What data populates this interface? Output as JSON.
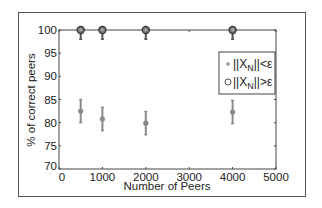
{
  "chart_data": {
    "type": "scatter",
    "title": "",
    "xlabel": "Number of Peers",
    "ylabel": "% of correct peers",
    "xlim": [
      0,
      5000
    ],
    "ylim": [
      70,
      100
    ],
    "xticks": [
      0,
      1000,
      2000,
      3000,
      4000,
      5000
    ],
    "yticks": [
      70,
      75,
      80,
      85,
      90,
      95,
      100
    ],
    "grid": false,
    "legend_position": "upper right (inside)",
    "series": [
      {
        "name": "||X_N||<ε",
        "marker": "dot",
        "color": "#8a8a8a",
        "x": [
          500,
          1000,
          2000,
          4000
        ],
        "y": [
          82.5,
          80.8,
          79.9,
          82.3
        ],
        "error": [
          2.5,
          2.5,
          2.5,
          2.5
        ]
      },
      {
        "name": "||X_N||>ε",
        "marker": "circle",
        "color": "#555555",
        "x": [
          500,
          1000,
          2000,
          4000
        ],
        "y": [
          100,
          100,
          100,
          100
        ],
        "error_lower": [
          2.0,
          2.0,
          2.0,
          2.0
        ]
      }
    ]
  },
  "axes": {
    "xlabel": "Number of Peers",
    "ylabel": "% of correct peers",
    "xtick_labels": [
      "0",
      "1000",
      "2000",
      "3000",
      "4000",
      "5000"
    ],
    "ytick_labels": [
      "70",
      "75",
      "80",
      "85",
      "90",
      "95",
      "100"
    ]
  },
  "legend": {
    "items": [
      {
        "label_pre": "||X",
        "label_sub": "N",
        "label_post": "||<ε",
        "marker": "dot"
      },
      {
        "label_pre": "||X",
        "label_sub": "N",
        "label_post": "||>ε",
        "marker": "circle"
      }
    ]
  }
}
